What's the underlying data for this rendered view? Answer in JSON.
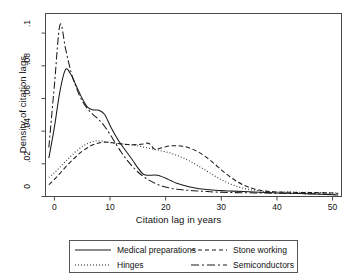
{
  "chart_data": {
    "type": "line",
    "title": "",
    "xlabel": "Citation lag in years",
    "ylabel": "Density of citation lags",
    "xlim": [
      -1.6,
      51.6
    ],
    "ylim": [
      0,
      0.112
    ],
    "xticks": [
      0,
      10,
      20,
      30,
      40,
      50
    ],
    "xtick_labels": [
      "0",
      "10",
      "20",
      "30",
      "40",
      "50"
    ],
    "yticks": [
      0,
      0.02,
      0.04,
      0.06,
      0.08,
      0.1
    ],
    "ytick_labels": [
      "0",
      ".02",
      ".04",
      ".06",
      ".08",
      ".1"
    ],
    "grid": false,
    "legend_position": "below-plot",
    "series": [
      {
        "name": "Medical preparations",
        "style": "solid",
        "color": "#1a1a1a",
        "x": [
          -1,
          0,
          1,
          2,
          3,
          4,
          5,
          6,
          7,
          8,
          9,
          10,
          11,
          12,
          13,
          14,
          15,
          16,
          17,
          18,
          19,
          20,
          21,
          22,
          23,
          24,
          25,
          26,
          27,
          28,
          29,
          30,
          32,
          34,
          36,
          38,
          40,
          42,
          44,
          46,
          48,
          50,
          51
        ],
        "y": [
          0.0235,
          0.0425,
          0.0645,
          0.0777,
          0.0745,
          0.0672,
          0.06,
          0.0545,
          0.053,
          0.0528,
          0.0503,
          0.0435,
          0.0372,
          0.0318,
          0.0272,
          0.0225,
          0.0175,
          0.0136,
          0.013,
          0.0131,
          0.0126,
          0.0112,
          0.0096,
          0.0081,
          0.007,
          0.0061,
          0.0054,
          0.0048,
          0.0044,
          0.0041,
          0.0038,
          0.0036,
          0.0033,
          0.003,
          0.0027,
          0.0024,
          0.0022,
          0.002,
          0.0018,
          0.0016,
          0.0014,
          0.0011,
          0.0009
        ]
      },
      {
        "name": "Hinges",
        "style": "dotted",
        "color": "#1a1a1a",
        "x": [
          -1,
          0,
          1,
          2,
          3,
          4,
          5,
          6,
          7,
          8,
          9,
          10,
          11,
          12,
          13,
          14,
          15,
          16,
          17,
          18,
          19,
          20,
          21,
          22,
          23,
          24,
          25,
          26,
          27,
          28,
          29,
          30,
          31,
          32,
          33,
          34,
          35,
          36,
          37,
          38,
          39,
          40,
          42,
          44,
          46,
          48,
          50,
          51
        ],
        "y": [
          0.0118,
          0.0145,
          0.018,
          0.0215,
          0.0248,
          0.028,
          0.0305,
          0.0325,
          0.0337,
          0.034,
          0.0337,
          0.033,
          0.0325,
          0.0322,
          0.0319,
          0.0315,
          0.031,
          0.0303,
          0.0295,
          0.0288,
          0.0281,
          0.0273,
          0.0264,
          0.0252,
          0.0238,
          0.0222,
          0.0204,
          0.0185,
          0.0164,
          0.0143,
          0.0122,
          0.0103,
          0.0086,
          0.0072,
          0.006,
          0.005,
          0.0043,
          0.0038,
          0.0034,
          0.0031,
          0.0029,
          0.0028,
          0.0027,
          0.0026,
          0.0025,
          0.0024,
          0.0022,
          0.002
        ]
      },
      {
        "name": "Stone working",
        "style": "dashed",
        "color": "#1a1a1a",
        "x": [
          -1,
          0,
          1,
          2,
          3,
          4,
          5,
          6,
          7,
          8,
          9,
          10,
          11,
          12,
          13,
          14,
          15,
          16,
          17,
          18,
          19,
          20,
          21,
          22,
          23,
          24,
          25,
          26,
          27,
          28,
          29,
          30,
          31,
          32,
          33,
          34,
          35,
          36,
          37,
          38,
          40,
          42,
          44,
          46,
          48,
          50,
          51
        ],
        "y": [
          0.0072,
          0.0105,
          0.0142,
          0.018,
          0.0215,
          0.0248,
          0.0277,
          0.03,
          0.0318,
          0.0328,
          0.0332,
          0.0331,
          0.0327,
          0.0322,
          0.0318,
          0.0317,
          0.0318,
          0.0321,
          0.0325,
          0.029,
          0.0295,
          0.0305,
          0.031,
          0.0311,
          0.0308,
          0.03,
          0.0287,
          0.027,
          0.0248,
          0.0222,
          0.0193,
          0.0163,
          0.0135,
          0.011,
          0.0088,
          0.007,
          0.0056,
          0.0045,
          0.0038,
          0.0033,
          0.0028,
          0.0026,
          0.0025,
          0.0024,
          0.0023,
          0.0021,
          0.0019
        ]
      },
      {
        "name": "Semiconductors",
        "style": "dashdot",
        "color": "#1a1a1a",
        "x": [
          -1,
          0,
          1,
          2,
          3,
          4,
          5,
          6,
          7,
          8,
          9,
          10,
          11,
          12,
          13,
          14,
          15,
          16,
          17,
          18,
          19,
          20,
          21,
          22,
          23,
          24,
          25,
          26,
          27,
          28,
          29,
          30,
          32,
          34,
          36,
          38,
          40,
          42,
          44,
          46,
          48,
          50,
          51
        ],
        "y": [
          0.03,
          0.068,
          0.105,
          0.0905,
          0.076,
          0.066,
          0.0585,
          0.0535,
          0.05,
          0.047,
          0.043,
          0.038,
          0.0325,
          0.0272,
          0.0225,
          0.0185,
          0.015,
          0.0122,
          0.01,
          0.0082,
          0.0068,
          0.0058,
          0.005,
          0.0045,
          0.0041,
          0.0038,
          0.0035,
          0.0033,
          0.0031,
          0.0029,
          0.0027,
          0.0026,
          0.0024,
          0.0023,
          0.0022,
          0.0021,
          0.002,
          0.0019,
          0.0018,
          0.0017,
          0.0016,
          0.0013,
          0.001
        ]
      }
    ]
  },
  "legend": {
    "entries": [
      {
        "label": "Medical preparations",
        "style": "solid"
      },
      {
        "label": "Hinges",
        "style": "dotted"
      },
      {
        "label": "Stone working",
        "style": "dashed"
      },
      {
        "label": "Semiconductors",
        "style": "dashdot"
      }
    ]
  }
}
